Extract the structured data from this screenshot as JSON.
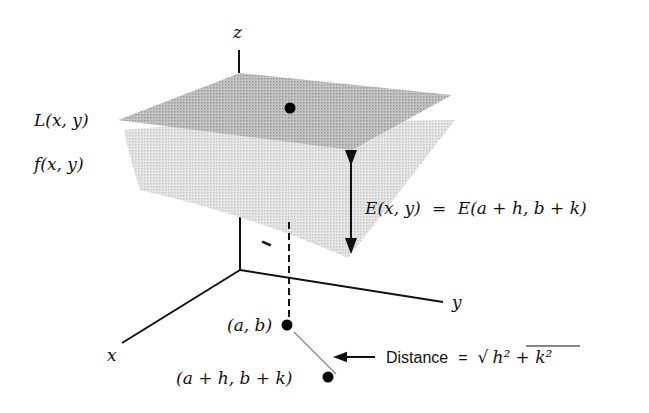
{
  "figure": {
    "axes": {
      "x_label": "x",
      "y_label": "y",
      "z_label": "z"
    },
    "surfaces": {
      "tangent_plane_label": "L(x, y)",
      "function_surface_label": "f(x, y)",
      "tangent_plane_color": "#b3b3b3",
      "function_surface_color": "#dadada"
    },
    "error": {
      "label_lhs": "E(x, y)",
      "equals": "=",
      "label_rhs": "E(a + h, b + k)"
    },
    "points": {
      "base_point": "(a, b)",
      "shifted_point": "(a + h, b + k)"
    },
    "distance": {
      "word": "Distance",
      "equals": "=",
      "formula": "h² + k²",
      "radical": "√"
    }
  }
}
